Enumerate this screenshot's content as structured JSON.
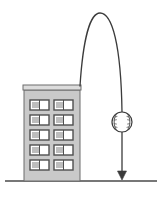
{
  "figure": {
    "background_color": "#ffffff",
    "width": 164,
    "height": 198
  },
  "ground": {
    "label": "ground-line",
    "color": "#4a4a4a",
    "y": 181,
    "x_start": 5,
    "x_end": 157,
    "thickness": 1.6
  },
  "building": {
    "label": "building",
    "fill_color": "#c9c9c9",
    "stroke_color": "#6d6d6d",
    "x": 24,
    "y": 85,
    "width": 56,
    "height": 96,
    "roof": {
      "label": "roof-band",
      "fill_color": "#dcdcdc",
      "stroke_color": "#6d6d6d",
      "x": 23,
      "y": 85,
      "width": 58,
      "height": 7
    },
    "windows": {
      "rows": 5,
      "columns": 2,
      "count": 10,
      "frame_color": "#4f4f4f",
      "pane_color": "#ffffff",
      "shade_color": "#bdbdbd",
      "width": 19,
      "height": 10,
      "col_x": [
        30,
        54
      ],
      "row_y": [
        100,
        115,
        130,
        145,
        160
      ]
    }
  },
  "trajectory": {
    "label": "projectile-path",
    "color": "#3b3b3b",
    "thickness": 1.3,
    "description": "parabolic arc up over the building then straight down",
    "apex": {
      "x": 100,
      "y": 13
    },
    "launch": {
      "x": 80,
      "y": 86
    },
    "descent_x": 122,
    "arrow_tip_y": 180
  },
  "baseball": {
    "label": "baseball",
    "fill_color": "#ffffff",
    "stroke_color": "#3b3b3b",
    "center_x": 122,
    "center_y": 122,
    "radius": 10,
    "stitch_color": "#5a5a5a",
    "stitch_count": 2
  },
  "arrow": {
    "label": "downward-arrow-head",
    "color": "#3b3b3b",
    "tip_x": 122,
    "tip_y": 180,
    "half_width": 4.5,
    "height": 10
  }
}
